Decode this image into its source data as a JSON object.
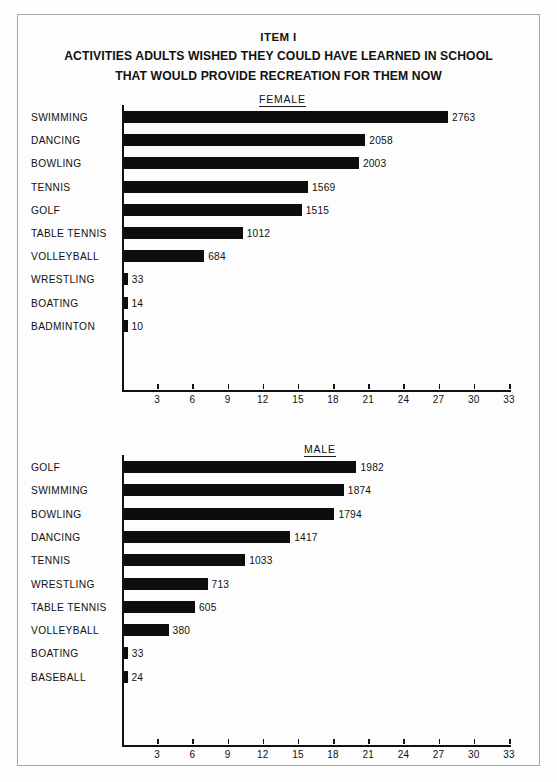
{
  "header": {
    "item_label": "ITEM I",
    "title_line1": "ACTIVITIES ADULTS WISHED THEY COULD HAVE LEARNED IN SCHOOL",
    "title_line2": "THAT WOULD PROVIDE RECREATION FOR THEM NOW"
  },
  "sections": {
    "female_label": "FEMALE",
    "male_label": "MALE"
  },
  "chart_data": [
    {
      "type": "bar",
      "orientation": "horizontal",
      "title": "FEMALE",
      "chart_group": "ITEM I",
      "xlabel": "",
      "ylabel": "",
      "xlim": [
        0,
        3300
      ],
      "axis_tick_labels": [
        "3",
        "6",
        "9",
        "12",
        "15",
        "18",
        "21",
        "24",
        "27",
        "30",
        "33"
      ],
      "axis_tick_values": [
        300,
        600,
        900,
        1200,
        1500,
        1800,
        2100,
        2400,
        2700,
        3000,
        3300
      ],
      "axis_scale_note": "tick labels are hundreds",
      "grid": false,
      "legend": "none",
      "categories": [
        "SWIMMING",
        "DANCING",
        "BOWLING",
        "TENNIS",
        "GOLF",
        "TABLE TENNIS",
        "VOLLEYBALL",
        "WRESTLING",
        "BOATING",
        "BADMINTON"
      ],
      "values": [
        2763,
        2058,
        2003,
        1569,
        1515,
        1012,
        684,
        33,
        14,
        10
      ],
      "value_labels": [
        "2763",
        "2058",
        "2003",
        "1569",
        "1515",
        "1012",
        "684",
        "33",
        "14",
        "10"
      ]
    },
    {
      "type": "bar",
      "orientation": "horizontal",
      "title": "MALE",
      "chart_group": "ITEM I",
      "xlabel": "",
      "ylabel": "",
      "xlim": [
        0,
        3300
      ],
      "axis_tick_labels": [
        "3",
        "6",
        "9",
        "12",
        "15",
        "18",
        "21",
        "24",
        "27",
        "30",
        "33"
      ],
      "axis_tick_values": [
        300,
        600,
        900,
        1200,
        1500,
        1800,
        2100,
        2400,
        2700,
        3000,
        3300
      ],
      "axis_scale_note": "tick labels are hundreds",
      "grid": false,
      "legend": "none",
      "categories": [
        "GOLF",
        "SWIMMING",
        "BOWLING",
        "DANCING",
        "TENNIS",
        "WRESTLING",
        "TABLE TENNIS",
        "VOLLEYBALL",
        "BOATING",
        "BASEBALL"
      ],
      "values": [
        1982,
        1874,
        1794,
        1417,
        1033,
        713,
        605,
        380,
        33,
        24
      ],
      "value_labels": [
        "1982",
        "1874",
        "1794",
        "1417",
        "1033",
        "713",
        "605",
        "380",
        "33",
        "24"
      ]
    }
  ],
  "colors": {
    "bar": "#0d0d0d",
    "axis": "#111111",
    "frame": "#a8a8a8",
    "background": "#fdfdfd"
  }
}
